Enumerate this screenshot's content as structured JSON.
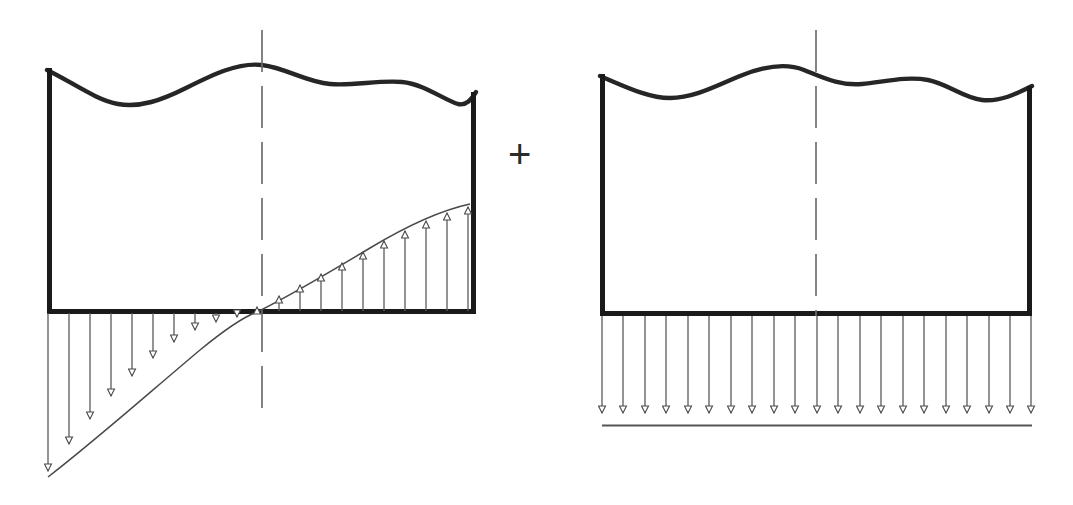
{
  "figure": {
    "canvas": {
      "width": 1073,
      "height": 505,
      "background": "#ffffff"
    },
    "operator": {
      "symbol": "+",
      "name": "plus-operator",
      "x": 508,
      "y": 134
    },
    "colors": {
      "block_outline": "#1a1a1a",
      "wavy_break_line": "#262626",
      "load_line": "#555555",
      "arrow_stroke": "#5a5a5a",
      "centerline": "#6e6e6e",
      "distribution_curve": "#4a4a4a"
    }
  },
  "diagrams": [
    {
      "name": "left-diagram",
      "label": "Triangular / curved pressure distribution",
      "block": {
        "left": 47,
        "right": 476,
        "bottom": 313,
        "top_nominal": 70,
        "outline_width": 5,
        "wavy_top": "M47,70 C72,82 96,100 118,104 C140,108 162,100 186,88 C212,75 238,62 262,65 C286,68 306,82 330,84 C354,86 378,80 402,82 C424,84 444,100 458,104 C466,106 471,100 476,92"
      },
      "centerline": {
        "x": 262,
        "top": 30,
        "bottom": 410,
        "dash": "42 14"
      },
      "distribution": {
        "type": "curved",
        "description": "Concave-up curve crossing the base at the centerline; downward (negative) pressure on the left, upward (positive) pressure on the right",
        "zero_crossing_x": 257,
        "curve_path": "M48,477 C96,440 150,392 200,350 C228,327 246,316 257,312 C290,296 330,272 370,248 C405,227 442,210 470,204",
        "down_arrows": {
          "count": 10,
          "direction": "down",
          "base_y": 313,
          "xs": [
            48,
            69,
            90,
            111,
            132,
            153,
            174,
            195,
            216,
            237
          ],
          "tip_ys": [
            477,
            450,
            425,
            402,
            382,
            364,
            348,
            334,
            324,
            316
          ]
        },
        "up_arrows": {
          "count": 11,
          "direction": "up",
          "base_y": 313,
          "xs": [
            257,
            279,
            300,
            321,
            342,
            363,
            384,
            405,
            426,
            447,
            468
          ],
          "tip_ys": [
            311,
            299,
            287,
            276,
            265,
            254,
            243,
            232,
            221,
            211,
            205
          ]
        }
      }
    },
    {
      "name": "right-diagram",
      "label": "Uniform pressure distribution",
      "block": {
        "left": 600,
        "right": 1032,
        "bottom": 315,
        "top_nominal": 70,
        "outline_width": 5,
        "wavy_top": "M600,76 C624,86 648,98 670,98 C694,98 716,86 740,76 C762,67 784,62 804,70 C824,78 840,86 862,84 C884,82 906,76 928,80 C948,84 964,98 982,100 C1000,102 1016,94 1032,86"
      },
      "centerline": {
        "x": 816,
        "top": 30,
        "bottom": 316,
        "dash": "42 14"
      },
      "distribution": {
        "type": "uniform",
        "description": "Constant downward pressure across the full base width",
        "base_y": 315,
        "load_line_y": 425,
        "load_line_from_x": 602,
        "load_line_to_x": 1032,
        "arrows": {
          "count": 21,
          "direction": "down",
          "tip_y": 419,
          "xs": [
            602,
            623,
            645,
            666,
            688,
            709,
            731,
            752,
            774,
            795,
            817,
            838,
            860,
            881,
            903,
            924,
            946,
            967,
            989,
            1010,
            1031
          ]
        }
      }
    }
  ]
}
